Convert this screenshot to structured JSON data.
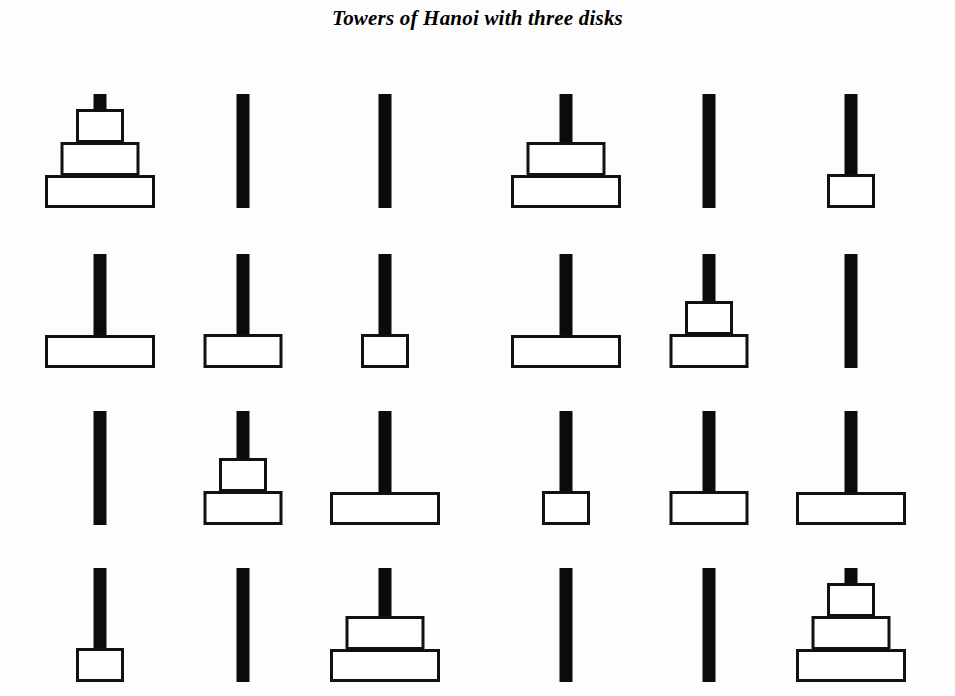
{
  "figure": {
    "title": "Towers of Hanoi with three disks",
    "background_color": "#fdfdfd",
    "peg_color": "#0b0b0b",
    "disk_fill_color": "#ffffff",
    "disk_outline_color": "#111111"
  },
  "puzzle": {
    "num_disks": 3,
    "num_pegs": 3,
    "num_states": 8,
    "num_moves": 7,
    "peg_names": [
      "A",
      "B",
      "C"
    ],
    "disk_sizes": [
      1,
      2,
      3
    ]
  },
  "chart_data": {
    "type": "diagram",
    "title": "Towers of Hanoi with three disks",
    "layout": {
      "rows": 4,
      "states_per_row": 2,
      "reading_order": "left-to-right, top-to-bottom"
    },
    "states": [
      {
        "index": 1,
        "row": 1,
        "column": 1,
        "pegs": [
          [
            3,
            2,
            1
          ],
          [],
          []
        ]
      },
      {
        "index": 2,
        "row": 1,
        "column": 2,
        "pegs": [
          [
            3,
            2
          ],
          [],
          [
            1
          ]
        ]
      },
      {
        "index": 3,
        "row": 2,
        "column": 1,
        "pegs": [
          [
            3
          ],
          [
            2
          ],
          [
            1
          ]
        ]
      },
      {
        "index": 4,
        "row": 2,
        "column": 2,
        "pegs": [
          [
            3
          ],
          [
            2,
            1
          ],
          []
        ]
      },
      {
        "index": 5,
        "row": 3,
        "column": 1,
        "pegs": [
          [],
          [
            2,
            1
          ],
          [
            3
          ]
        ]
      },
      {
        "index": 6,
        "row": 3,
        "column": 2,
        "pegs": [
          [
            1
          ],
          [
            2
          ],
          [
            3
          ]
        ]
      },
      {
        "index": 7,
        "row": 4,
        "column": 1,
        "pegs": [
          [
            1
          ],
          [],
          [
            3,
            2
          ]
        ]
      },
      {
        "index": 8,
        "row": 4,
        "column": 2,
        "pegs": [
          [],
          [],
          [
            3,
            2,
            1
          ]
        ]
      }
    ]
  }
}
